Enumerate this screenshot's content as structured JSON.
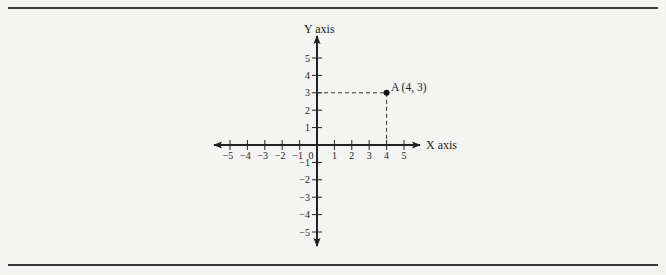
{
  "diagram": {
    "type": "cartesian-coordinate-plane",
    "y_axis_label": "Y axis",
    "x_axis_label": "X axis",
    "origin_label": "0",
    "x_ticks": [
      "−5",
      "−4",
      "−3",
      "−2",
      "−1",
      "1",
      "2",
      "3",
      "4",
      "5"
    ],
    "y_ticks": [
      "5",
      "4",
      "3",
      "2",
      "1",
      "−1",
      "−2",
      "−3",
      "−4",
      "−5"
    ],
    "point": {
      "label": "A (4, 3)",
      "x": 4,
      "y": 3
    },
    "x_range": [
      -5,
      5
    ],
    "y_range": [
      -5,
      5
    ],
    "colors": {
      "axis": "#222222",
      "point": "#111111",
      "rule": "#3a3a3a",
      "background": "#f4f4f3"
    }
  }
}
